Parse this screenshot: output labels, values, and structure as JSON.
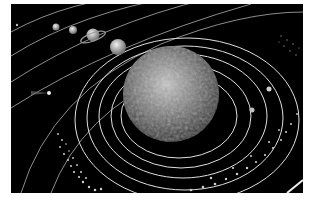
{
  "image": {
    "subject": "Solar system illustration",
    "description": "Planets orbiting a large textured sun on concentric orbit lines against a black background, with a comet and asteroid belts",
    "colors": {
      "background": "#000000",
      "orbit": "#d8d8d8",
      "sun": "#9a9a9a",
      "page": "#ffffff"
    }
  },
  "elements": {
    "sun": "sun",
    "planets": [
      "mercury-like",
      "venus-like",
      "saturn",
      "jupiter"
    ],
    "comet": "comet",
    "asteroid_belts": [
      "outer-belt-right",
      "belt-lower-left",
      "belt-lower-right"
    ]
  }
}
